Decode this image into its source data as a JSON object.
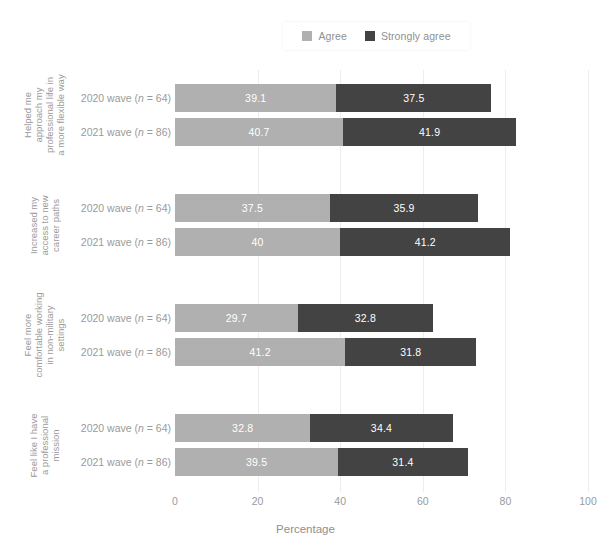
{
  "legend": {
    "entries": [
      {
        "label": "Agree",
        "color": "#b0b0b0",
        "icon": "legend-swatch-agree"
      },
      {
        "label": "Strongly agree",
        "color": "#434343",
        "icon": "legend-swatch-strongly-agree"
      }
    ]
  },
  "axis": {
    "x_title": "Percentage",
    "ticks": [
      "0",
      "20",
      "40",
      "60",
      "80",
      "100"
    ]
  },
  "waves": {
    "wave2020_prefix": "2020 wave (",
    "wave2021_prefix": "2021 wave (",
    "n_symbol": "n",
    "wave2020_suffix": " = 64)",
    "wave2021_suffix": " = 86)"
  },
  "groups": [
    {
      "title_lines": [
        "Helped me",
        "approach my",
        "professional life in",
        "a more flexible way"
      ],
      "rows": [
        {
          "wave": "2020 wave (n = 64)",
          "agree": 39.1,
          "strongly_agree": 37.5,
          "agree_label": "39.1",
          "strongly_label": "37.5"
        },
        {
          "wave": "2021 wave (n = 86)",
          "agree": 40.7,
          "strongly_agree": 41.9,
          "agree_label": "40.7",
          "strongly_label": "41.9"
        }
      ]
    },
    {
      "title_lines": [
        "Increased my",
        "access to new",
        "career paths"
      ],
      "rows": [
        {
          "wave": "2020 wave (n = 64)",
          "agree": 37.5,
          "strongly_agree": 35.9,
          "agree_label": "37.5",
          "strongly_label": "35.9"
        },
        {
          "wave": "2021 wave (n = 86)",
          "agree": 40.0,
          "strongly_agree": 41.2,
          "agree_label": "40",
          "strongly_label": "41.2"
        }
      ]
    },
    {
      "title_lines": [
        "Feel more",
        "comfortable working",
        "in non-military",
        "settings"
      ],
      "rows": [
        {
          "wave": "2020 wave (n = 64)",
          "agree": 29.7,
          "strongly_agree": 32.8,
          "agree_label": "29.7",
          "strongly_label": "32.8"
        },
        {
          "wave": "2021 wave (n = 86)",
          "agree": 41.2,
          "strongly_agree": 31.8,
          "agree_label": "41.2",
          "strongly_label": "31.8"
        }
      ]
    },
    {
      "title_lines": [
        "Feel like I have",
        "a professional",
        "mission"
      ],
      "rows": [
        {
          "wave": "2020 wave (n = 64)",
          "agree": 32.8,
          "strongly_agree": 34.4,
          "agree_label": "32.8",
          "strongly_label": "34.4"
        },
        {
          "wave": "2021 wave (n = 86)",
          "agree": 39.5,
          "strongly_agree": 31.4,
          "agree_label": "39.5",
          "strongly_label": "31.4"
        }
      ]
    }
  ],
  "chart_data": {
    "type": "bar",
    "orientation": "horizontal",
    "stacked": true,
    "title": "",
    "xlabel": "Percentage",
    "ylabel": "",
    "xlim": [
      0,
      100
    ],
    "xticks": [
      0,
      20,
      40,
      60,
      80,
      100
    ],
    "grid": "vertical-light",
    "legend_position": "top-center",
    "colors": {
      "Agree": "#b0b0b0",
      "Strongly agree": "#434343"
    },
    "categories": [
      "Helped me approach my professional life in a more flexible way — 2020 wave (n = 64)",
      "Helped me approach my professional life in a more flexible way — 2021 wave (n = 86)",
      "Increased my access to new career paths — 2020 wave (n = 64)",
      "Increased my access to new career paths — 2021 wave (n = 86)",
      "Feel more comfortable working in non-military settings — 2020 wave (n = 64)",
      "Feel more comfortable working in non-military settings — 2021 wave (n = 86)",
      "Feel like I have a professional mission — 2020 wave (n = 64)",
      "Feel like I have a professional mission — 2021 wave (n = 86)"
    ],
    "series": [
      {
        "name": "Agree",
        "values": [
          39.1,
          40.7,
          37.5,
          40.0,
          29.7,
          41.2,
          32.8,
          39.5
        ]
      },
      {
        "name": "Strongly agree",
        "values": [
          37.5,
          41.9,
          35.9,
          41.2,
          32.8,
          31.8,
          34.4,
          31.4
        ]
      }
    ],
    "totals": [
      76.6,
      82.6,
      73.4,
      81.2,
      62.5,
      73.0,
      67.2,
      70.9
    ]
  }
}
